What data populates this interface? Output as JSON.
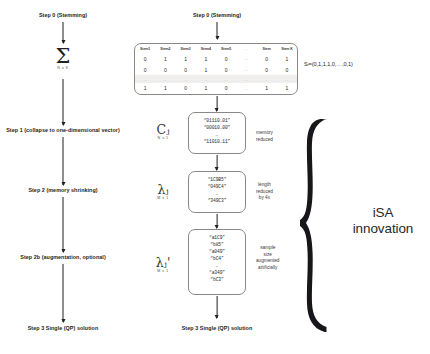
{
  "diagram": {
    "left_column": {
      "steps": [
        {
          "label": "Step 0 (Stemming)"
        },
        {
          "label": "Step 1 (collapse to one-dimensional vector)"
        },
        {
          "label": "Step 2 (memory shrinking)"
        },
        {
          "label": "Step 2b (augmentation, optional)"
        },
        {
          "label": "Step 3 Single (QP) solution"
        }
      ],
      "sigma": {
        "glyph": "Σ",
        "dimension": "N x K"
      }
    },
    "right_column": {
      "top_step": "Step 0 (Stemming)",
      "bottom_step": "Step 3 Single (QP) solution",
      "matrix": {
        "headers": [
          "Stem1",
          "Stem2",
          "Stem3",
          "Stem4",
          "Stem5",
          "...",
          "Stem",
          "Stem K"
        ],
        "rows": [
          [
            "0",
            "1",
            "1",
            "1",
            "0",
            "...",
            "0",
            "1"
          ],
          [
            "0",
            "0",
            "0",
            "1",
            "0",
            "...",
            "0",
            "0"
          ],
          [
            "...",
            "...",
            "...",
            "...",
            "...",
            "...",
            "...",
            "..."
          ],
          [
            "1",
            "1",
            "0",
            "1",
            "0",
            "...",
            "1",
            "1"
          ]
        ],
        "separator_index": 2
      },
      "si_vector": "Sᵢ=(0,1,1,1,0,…,0,1)",
      "boxes": [
        {
          "symbol": "Cⱼ",
          "dimension": "N x 1",
          "lines": [
            "“01110…01”",
            "“00010…00”",
            "…",
            "“11010…11”"
          ],
          "note": "memory\nreduced"
        },
        {
          "symbol": "λⱼ",
          "dimension": "M x 1",
          "lines": [
            "“1C9B5”",
            "“049C4”",
            "…",
            "“349C3”"
          ],
          "note": "length\nreduced\nby 4x"
        },
        {
          "symbol": "λⱼ'",
          "dimension": "M x 1",
          "lines": [
            "“a1C9”",
            "“b85”",
            "“a049”",
            "“bC4”",
            "…",
            "“a349”",
            "“bC3”"
          ],
          "note": "sample\nsize\naugmented\nartificially"
        }
      ]
    },
    "brace_annotation": {
      "line1": "iSA",
      "line2": "innovation"
    },
    "notes": {
      "memory_reduced": [
        "memory",
        "reduced"
      ],
      "length_reduced": [
        "length",
        "reduced",
        "by 4x"
      ],
      "sample_augmented": [
        "sample",
        "size",
        "augmented",
        "artificially"
      ]
    },
    "colors": {
      "ink": "#231f20",
      "rule": "#8c8885",
      "shade": "#f0eeec"
    }
  }
}
